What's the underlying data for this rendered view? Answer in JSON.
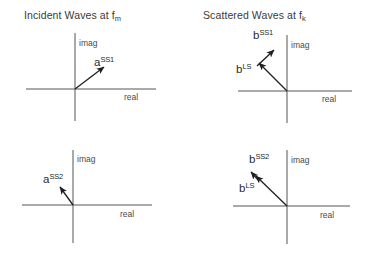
{
  "figure": {
    "background_color": "#ffffff",
    "axis_color": "#555555",
    "vector_color": "#1f1f1f",
    "text_color": "#3a3a3a"
  },
  "panels": [
    {
      "id": "incident-ss1",
      "title_main": "Incident Waves at f",
      "title_sub": "m",
      "imag_label": "imag",
      "real_label": "real",
      "vectors": [
        {
          "name": "a-ss1",
          "base": "a",
          "exponent": "SS1",
          "quadrant": "first"
        }
      ]
    },
    {
      "id": "scattered-ss1",
      "title_main": "Scattered Waves at f",
      "title_sub": "k",
      "imag_label": "imag",
      "real_label": "real",
      "vectors": [
        {
          "name": "b-ls",
          "base": "b",
          "exponent": "LS",
          "quadrant": "second"
        },
        {
          "name": "b-ss1",
          "base": "b",
          "exponent": "SS1",
          "quadrant": "second"
        }
      ]
    },
    {
      "id": "incident-ss2",
      "title_main": "",
      "title_sub": "",
      "imag_label": "imag",
      "real_label": "real",
      "vectors": [
        {
          "name": "a-ss2",
          "base": "a",
          "exponent": "SS2",
          "quadrant": "second"
        }
      ]
    },
    {
      "id": "scattered-ss2",
      "title_main": "",
      "title_sub": "",
      "imag_label": "imag",
      "real_label": "real",
      "vectors": [
        {
          "name": "b-ls-2",
          "base": "b",
          "exponent": "LS",
          "quadrant": "second"
        },
        {
          "name": "b-ss2",
          "base": "b",
          "exponent": "SS2",
          "quadrant": "second"
        }
      ]
    }
  ],
  "labels": {
    "title_left": "Incident Waves at f",
    "title_left_sub": "m",
    "title_right": "Scattered Waves at f",
    "title_right_sub": "k",
    "imag": "imag",
    "real": "real",
    "a_base": "a",
    "b_base": "b",
    "exp_ss1": "SS1",
    "exp_ss2": "SS2",
    "exp_ls": "LS"
  }
}
